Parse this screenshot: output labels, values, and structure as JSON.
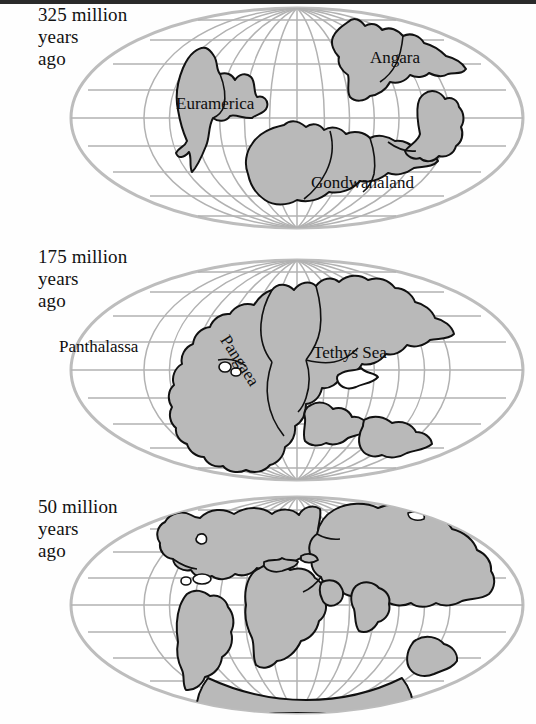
{
  "figure": {
    "projection": "Mollweide (oval world projection) with latitude/longitude graticule",
    "background_color": "#ffffff",
    "land_fill_color": "#b9b9b9",
    "land_outline_color": "#111111",
    "graticule_color": "#b0b0b0",
    "ocean_color": "#ffffff",
    "text_color": "#111111",
    "top_rule_color": "#2a2a2a"
  },
  "gutter_fragments": [
    {
      "char": "e",
      "top": 68
    },
    {
      "char": "e",
      "top": 153
    },
    {
      "char": "t",
      "top": 332
    }
  ],
  "maps": [
    {
      "id": "map-325",
      "caption": "325 million\nyears\nago",
      "caption_lines": [
        "325 million",
        "years",
        "ago"
      ],
      "age_value": 325,
      "age_unit": "million years ago",
      "labels": [
        {
          "name": "euramerica",
          "text": "Euramerica",
          "x": 118,
          "y": 94,
          "size": 17,
          "rotation": 0
        },
        {
          "name": "angara",
          "text": "Angara",
          "x": 312,
          "y": 48,
          "size": 17,
          "rotation": 0
        },
        {
          "name": "gondwanaland",
          "text": "Gondwanaland",
          "x": 253,
          "y": 173,
          "size": 17,
          "rotation": 0
        }
      ]
    },
    {
      "id": "map-175",
      "caption": "175 million\nyears\nago",
      "caption_lines": [
        "175 million",
        "years",
        "ago"
      ],
      "age_value": 175,
      "age_unit": "million years ago",
      "labels": [
        {
          "name": "panthalassa",
          "text": "Panthalassa",
          "x": 59,
          "y": 343,
          "size": 17,
          "rotation": 0
        },
        {
          "name": "pangaea",
          "text": "Pangaea",
          "x": 224,
          "y": 333,
          "size": 17,
          "rotation": 57
        },
        {
          "name": "tethys-sea",
          "text": "Tethys Sea",
          "x": 313,
          "y": 349,
          "size": 17,
          "rotation": 0
        }
      ]
    },
    {
      "id": "map-50",
      "caption": "50 million\nyears\nago",
      "caption_lines": [
        "50 million",
        "years",
        "ago"
      ],
      "age_value": 50,
      "age_unit": "million years ago",
      "labels": []
    }
  ]
}
